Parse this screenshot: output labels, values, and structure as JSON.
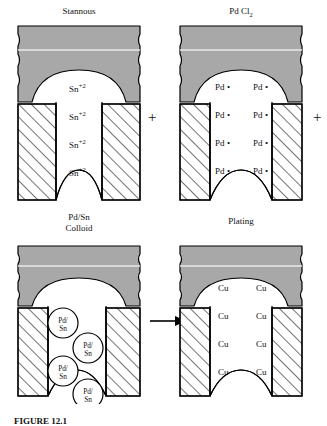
{
  "figure": {
    "type": "process-diagram",
    "caption": "FIGURE 12.1"
  },
  "colors": {
    "laminate_gray": "#a8a8a8",
    "laminate_gray_light": "#c9c9c9",
    "outline": "#000000",
    "hatch": "#000000",
    "background": "#ffffff"
  },
  "panels": [
    {
      "id": "stannous",
      "title": "Stannous",
      "title_lines": [
        "Stannous"
      ],
      "species_label": "Sn",
      "species_charge": "+2",
      "species_columns": 1,
      "species_rows": 4,
      "species_items": [
        {
          "text": "Sn",
          "sup": "+2"
        },
        {
          "text": "Sn",
          "sup": "+2"
        },
        {
          "text": "Sn",
          "sup": "+2"
        },
        {
          "text": "Sn",
          "sup": "+2"
        }
      ]
    },
    {
      "id": "pdcl2",
      "title": "Pd Cl2",
      "title_main": "Pd Cl",
      "title_sub": "2",
      "title_lines": [
        "Pd Cl2"
      ],
      "species_label": "Pd",
      "species_marker": "•",
      "species_columns": 2,
      "species_rows": 4,
      "species_items": [
        {
          "text": "Pd",
          "marker": "•"
        },
        {
          "text": "Pd",
          "marker": "•"
        },
        {
          "text": "Pd",
          "marker": "•"
        },
        {
          "text": "Pd",
          "marker": "•"
        },
        {
          "text": "Pd",
          "marker": "•"
        },
        {
          "text": "Pd",
          "marker": "•"
        },
        {
          "text": "Pd",
          "marker": "•"
        },
        {
          "text": "Pd",
          "marker": "•"
        }
      ]
    },
    {
      "id": "colloid",
      "title": "Pd/Sn Colloid",
      "title_lines": [
        "Pd/Sn",
        "Colloid"
      ],
      "species_label": "Pd/Sn",
      "colloid_line1": "Pd/",
      "colloid_line2": "Sn",
      "colloid_count": 4,
      "colloids": [
        {
          "line1": "Pd/",
          "line2": "Sn"
        },
        {
          "line1": "Pd/",
          "line2": "Sn"
        },
        {
          "line1": "Pd/",
          "line2": "Sn"
        },
        {
          "line1": "Pd/",
          "line2": "Sn"
        }
      ]
    },
    {
      "id": "plating",
      "title": "Plating",
      "title_lines": [
        "Plating"
      ],
      "species_label": "Cu",
      "species_columns": 2,
      "species_rows": 4,
      "species_items": [
        {
          "text": "Cu"
        },
        {
          "text": "Cu"
        },
        {
          "text": "Cu"
        },
        {
          "text": "Cu"
        },
        {
          "text": "Cu"
        },
        {
          "text": "Cu"
        },
        {
          "text": "Cu"
        },
        {
          "text": "Cu"
        }
      ]
    }
  ],
  "operators": {
    "plus_middle": "+",
    "plus_right": "+",
    "arrow": "→"
  }
}
